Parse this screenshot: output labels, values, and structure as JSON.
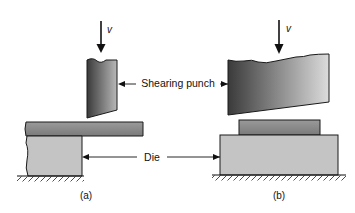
{
  "diagram": {
    "labels": {
      "velocity_a": "v",
      "velocity_b": "v",
      "shearing_punch": "Shearing punch",
      "die": "Die",
      "caption_a": "(a)",
      "caption_b": "(b)"
    },
    "colors": {
      "punch_dark": "#3a3a3a",
      "punch_light": "#d8d8d8",
      "sheet": "#8a8a8a",
      "die": "#c4c4c4",
      "outline": "#1a1a1a"
    }
  }
}
